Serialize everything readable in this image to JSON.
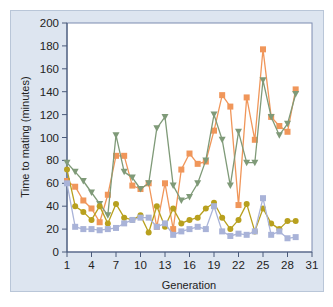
{
  "chart_data": {
    "type": "line",
    "title": "",
    "xlabel": "Generation",
    "ylabel": "Time to mating (minutes)",
    "xlim": [
      1,
      31
    ],
    "ylim": [
      0,
      200
    ],
    "x_ticks": [
      1,
      4,
      7,
      10,
      13,
      16,
      19,
      22,
      25,
      28,
      31
    ],
    "y_ticks": [
      0,
      20,
      40,
      60,
      80,
      100,
      120,
      140,
      160,
      180,
      200
    ],
    "grid": false,
    "legend": null,
    "x": [
      1,
      2,
      3,
      4,
      5,
      6,
      7,
      8,
      9,
      10,
      11,
      12,
      13,
      14,
      15,
      16,
      17,
      18,
      19,
      20,
      21,
      22,
      23,
      24,
      25,
      26,
      27,
      28,
      29
    ],
    "series": [
      {
        "name": "Line A (orange squares)",
        "color": "#f0965a",
        "marker": "square",
        "values": [
          62,
          57,
          45,
          38,
          26,
          50,
          84,
          84,
          58,
          55,
          60,
          22,
          60,
          20,
          72,
          86,
          77,
          79,
          106,
          137,
          127,
          41,
          135,
          98,
          177,
          118,
          110,
          105,
          142
        ]
      },
      {
        "name": "Line B (green triangles)",
        "color": "#7f9a78",
        "marker": "triangle-down",
        "values": [
          78,
          70,
          62,
          52,
          42,
          32,
          102,
          70,
          65,
          55,
          60,
          108,
          118,
          58,
          45,
          48,
          60,
          80,
          120,
          98,
          58,
          105,
          78,
          78,
          150,
          118,
          102,
          112,
          138
        ]
      },
      {
        "name": "Line C (olive circles)",
        "color": "#b8a01e",
        "marker": "circle",
        "values": [
          72,
          40,
          35,
          28,
          40,
          25,
          42,
          30,
          28,
          32,
          17,
          40,
          22,
          38,
          25,
          28,
          30,
          38,
          43,
          30,
          20,
          28,
          42,
          18,
          38,
          25,
          20,
          27,
          27
        ]
      },
      {
        "name": "Line D (lavender squares)",
        "color": "#a9b3d8",
        "marker": "square",
        "values": [
          60,
          22,
          20,
          20,
          19,
          20,
          21,
          25,
          28,
          30,
          30,
          22,
          25,
          15,
          18,
          20,
          22,
          20,
          40,
          18,
          14,
          16,
          15,
          18,
          47,
          15,
          18,
          12,
          13
        ]
      }
    ]
  },
  "axes": {
    "x_title": "Generation",
    "y_title": "Time to mating (minutes)"
  },
  "colors": {
    "frame_bg": "#dde5f0",
    "plot_bg": "#ffffff",
    "axis": "#4a5a7a"
  }
}
